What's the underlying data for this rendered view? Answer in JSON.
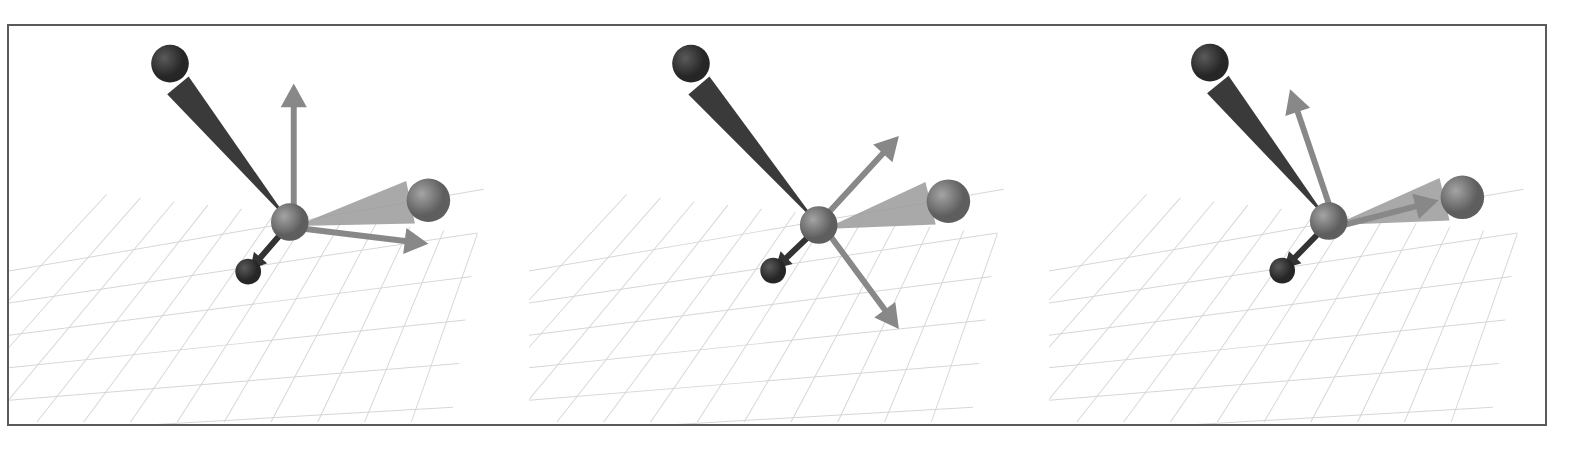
{
  "figure": {
    "panel_count": 3,
    "frame_color": "#5a5a5a",
    "grid_color": "#d6d6d6",
    "colors": {
      "dark_bone": "#3a3a3a",
      "dark_bone_edge": "#2a2a2a",
      "light_bone": "#8a8a8a",
      "light_bone_translucent": "#9a9a9a",
      "joint": "#7c7c7c",
      "light_arrow": "#888888",
      "dark_arrow": "#333333"
    },
    "panels": [
      {
        "id": "panel-1",
        "label": "Panel 1",
        "offset_x": 0,
        "joint": [
          288,
          222
        ],
        "dark_sphere": [
          167,
          62
        ],
        "light_sphere": [
          428,
          200
        ],
        "dark_arrow_tip": [
          240,
          278
        ],
        "light_arrow_tip_a": [
          292,
          82
        ],
        "light_arrow_tip_b": [
          428,
          244
        ]
      },
      {
        "id": "panel-2",
        "label": "Panel 2",
        "offset_x": 520,
        "joint": [
          297,
          225
        ],
        "dark_sphere": [
          168,
          62
        ],
        "light_sphere": [
          428,
          201
        ],
        "dark_arrow_tip": [
          245,
          277
        ],
        "light_arrow_tip_a": [
          378,
          135
        ],
        "light_arrow_tip_b": [
          378,
          330
        ]
      },
      {
        "id": "panel-3",
        "label": "Panel 3",
        "offset_x": 1040,
        "joint": [
          287,
          221
        ],
        "dark_sphere": [
          167,
          61
        ],
        "light_sphere": [
          422,
          197
        ],
        "dark_arrow_tip": [
          234,
          277
        ],
        "light_arrow_tip_a": [
          248,
          88
        ],
        "light_arrow_tip_b": [
          398,
          200
        ]
      }
    ]
  }
}
